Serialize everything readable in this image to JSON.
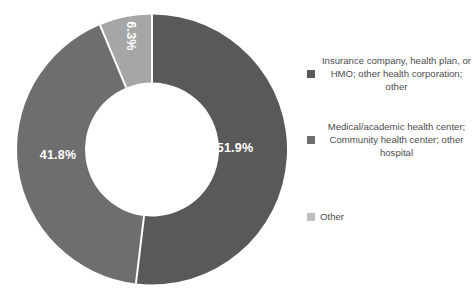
{
  "chart_data": {
    "type": "pie",
    "variant": "donut",
    "title": "",
    "subtitle": "",
    "xlabel": "",
    "ylabel": "",
    "grid": false,
    "legend_position": "right",
    "hole_ratio": 0.5,
    "start_angle_deg": 0,
    "direction": "clockwise",
    "categories": [
      "Insurance company, health plan, or HMO; other health corporation; other",
      "Medical/academic health center; Community health center; other hospital",
      "Other"
    ],
    "values": [
      51.9,
      41.8,
      6.3
    ],
    "data_labels": [
      "51.9%",
      "41.8%",
      "6.3%"
    ],
    "colors": [
      "#595959",
      "#6e6e6e",
      "#a6a6a6"
    ],
    "separator_color": "#ffffff",
    "data_label_color": "#ffffff"
  },
  "legend": {
    "items": [
      {
        "label": "Insurance company, health plan, or HMO; other health corporation; other",
        "color": "#595959"
      },
      {
        "label": "Medical/academic health center; Community health center; other hospital",
        "color": "#6e6e6e"
      },
      {
        "label": "Other",
        "color": "#bfbfbf"
      }
    ]
  }
}
